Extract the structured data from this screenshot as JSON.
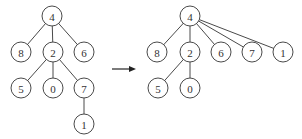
{
  "diagram": {
    "type": "tree-transformation",
    "before": {
      "root": "n4",
      "nodes": [
        {
          "id": "n4",
          "label": "4"
        },
        {
          "id": "n8",
          "label": "8"
        },
        {
          "id": "n2",
          "label": "2"
        },
        {
          "id": "n6",
          "label": "6"
        },
        {
          "id": "n5",
          "label": "5"
        },
        {
          "id": "n0",
          "label": "0"
        },
        {
          "id": "n7",
          "label": "7"
        },
        {
          "id": "n1",
          "label": "1"
        }
      ],
      "edges": [
        [
          "n4",
          "n8"
        ],
        [
          "n4",
          "n2"
        ],
        [
          "n4",
          "n6"
        ],
        [
          "n2",
          "n5"
        ],
        [
          "n2",
          "n0"
        ],
        [
          "n2",
          "n7"
        ],
        [
          "n7",
          "n1"
        ]
      ]
    },
    "arrow": {
      "direction": "right"
    },
    "after": {
      "root": "m4",
      "nodes": [
        {
          "id": "m4",
          "label": "4"
        },
        {
          "id": "m8",
          "label": "8"
        },
        {
          "id": "m2",
          "label": "2"
        },
        {
          "id": "m6",
          "label": "6"
        },
        {
          "id": "m7",
          "label": "7"
        },
        {
          "id": "m1",
          "label": "1"
        },
        {
          "id": "m5",
          "label": "5"
        },
        {
          "id": "m0",
          "label": "0"
        }
      ],
      "edges": [
        [
          "m4",
          "m8"
        ],
        [
          "m4",
          "m2"
        ],
        [
          "m4",
          "m6"
        ],
        [
          "m4",
          "m7"
        ],
        [
          "m4",
          "m1"
        ],
        [
          "m2",
          "m5"
        ],
        [
          "m2",
          "m0"
        ]
      ]
    }
  }
}
